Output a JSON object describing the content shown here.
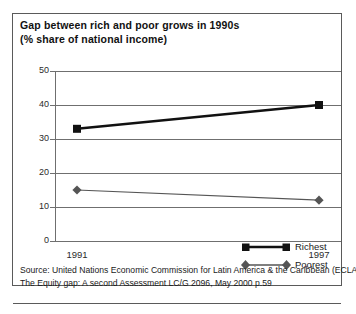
{
  "figure": {
    "title_lines": [
      "Gap between rich and poor grows in 1990s",
      "(% share of national income)"
    ],
    "source_lines": [
      "Source: United Nations Economic Commission for Latin America & the Caribbean (ECLAC)",
      "The Equity gap: A second Assessment LC/G 2096, May 2000 p.59"
    ]
  },
  "colors": {
    "richest": "#111111",
    "poorest": "#555555",
    "grid": "#6f6f6f",
    "border": "#5a5a5a",
    "text": "#1a1a1a"
  },
  "chart_data": {
    "type": "line",
    "title": "Gap between rich and poor grows in 1990s (% share of national income)",
    "xlabel": "",
    "ylabel": "",
    "categories": [
      "1991",
      "1997"
    ],
    "x": [
      1991,
      1997
    ],
    "xtick_labels": [
      "1991",
      "1997"
    ],
    "ytick_labels": [
      "0",
      "10",
      "20",
      "30",
      "40",
      "50"
    ],
    "yticks": [
      0,
      10,
      20,
      30,
      40,
      50
    ],
    "ylim": [
      0,
      50
    ],
    "grid": true,
    "legend_position": "inside-right",
    "series": [
      {
        "name": "Richest",
        "values": [
          33,
          40
        ],
        "marker": "square",
        "color": "#111111",
        "line_width": 2.6
      },
      {
        "name": "Poorest",
        "values": [
          15,
          12
        ],
        "marker": "diamond",
        "color": "#555555",
        "line_width": 1.2
      }
    ]
  }
}
